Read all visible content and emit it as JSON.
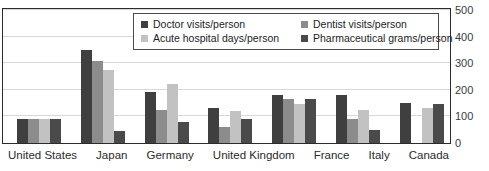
{
  "chart_data": {
    "type": "bar",
    "title": "",
    "subtitle": "",
    "xlabel": "",
    "ylabel": "",
    "ylim": [
      0,
      500
    ],
    "yticks": [
      0,
      100,
      200,
      300,
      400,
      500
    ],
    "ytick_labels": [
      "0",
      "100",
      "200",
      "300",
      "400",
      "500"
    ],
    "grid": true,
    "legend_position": "top-center-inside",
    "categories": [
      "United States",
      "Japan",
      "Germany",
      "United Kingdom",
      "France",
      "Italy",
      "Canada"
    ],
    "series": [
      {
        "name": "Doctor visits/person",
        "color": "#3f3f3f",
        "values": [
          90,
          350,
          190,
          130,
          180,
          180,
          150
        ]
      },
      {
        "name": "Dentist visits/person",
        "color": "#8c8c8c",
        "values": [
          90,
          310,
          125,
          60,
          165,
          90,
          0
        ]
      },
      {
        "name": "Acute hospital days/person",
        "color": "#c2c2c2",
        "values": [
          90,
          275,
          220,
          120,
          145,
          125,
          130
        ]
      },
      {
        "name": "Pharmaceutical grams/person",
        "color": "#4a4a4a",
        "values": [
          90,
          45,
          80,
          92,
          165,
          50,
          145
        ]
      }
    ]
  },
  "legend": {
    "entries": [
      {
        "label": "Doctor visits/person",
        "color": "#3f3f3f"
      },
      {
        "label": "Dentist visits/person",
        "color": "#8c8c8c"
      },
      {
        "label": "Acute hospital days/person",
        "color": "#c2c2c2"
      },
      {
        "label": "Pharmaceutical grams/person",
        "color": "#4a4a4a"
      }
    ]
  },
  "colors": {
    "plot_border": "#2b2b2b",
    "gridline": "#d8d8d8",
    "background": "#ffffff",
    "tick_text": "#3a3a3a",
    "label_text": "#2b2b2b"
  }
}
